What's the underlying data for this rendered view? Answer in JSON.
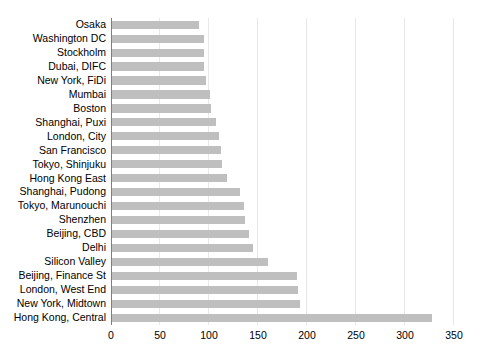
{
  "chart_data": {
    "type": "bar",
    "orientation": "horizontal",
    "title": "",
    "subtitle": "",
    "xlabel": "",
    "ylabel": "",
    "xlim": [
      0,
      350
    ],
    "xticks": [
      0,
      50,
      100,
      150,
      200,
      250,
      300,
      350
    ],
    "xtick_labels": [
      "0",
      "50",
      "100",
      "150",
      "200",
      "250",
      "300",
      "350"
    ],
    "grid": true,
    "grid_axis": "x",
    "legend": false,
    "legend_position": "none",
    "bar_color": "#bfbfbf",
    "axis_color": "#7f7f7f",
    "gridline_color": "#e8e8e8",
    "text_color": "#000000",
    "categories": [
      "Osaka",
      "Washington DC",
      "Stockholm",
      "Dubai, DIFC",
      "New York, FiDi",
      "Mumbai",
      "Boston",
      "Shanghai, Puxi",
      "London, City",
      "San Francisco",
      "Tokyo, Shinjuku",
      "Hong Kong East",
      "Shanghai, Pudong",
      "Tokyo, Marunouchi",
      "Shenzhen",
      "Beijing, CBD",
      "Delhi",
      "Silicon Valley",
      "Beijing, Finance St",
      "London, West End",
      "New York, Midtown",
      "Hong Kong, Central"
    ],
    "values": [
      90,
      95,
      95,
      95,
      97,
      101,
      102,
      107,
      110,
      112,
      113,
      118,
      132,
      136,
      137,
      141,
      145,
      160,
      190,
      191,
      193,
      328
    ]
  }
}
